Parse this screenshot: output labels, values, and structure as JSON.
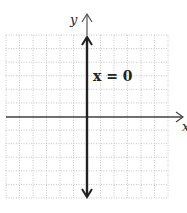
{
  "chart_data": {
    "type": "line",
    "title": "",
    "xlabel": "x",
    "ylabel": "y",
    "xlim": [
      -6,
      6
    ],
    "ylim": [
      -6,
      6
    ],
    "grid": true,
    "grid_style": "dotted",
    "series": [
      {
        "name": "x = 0",
        "equation": "x = 0",
        "kind": "vertical-line",
        "x": [
          0,
          0
        ],
        "y": [
          -6,
          6
        ]
      }
    ],
    "annotations": [
      {
        "text": "x = 0",
        "x": 0.3,
        "y": 3
      }
    ]
  },
  "labels": {
    "x_axis": "x",
    "y_axis": "y",
    "line_label": "x = 0"
  },
  "colors": {
    "grid": "#b8b8b8",
    "axis": "#333333",
    "line": "#222222"
  }
}
